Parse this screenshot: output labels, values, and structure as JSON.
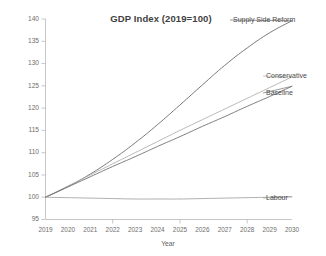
{
  "chart_data": {
    "type": "line",
    "title": "GDP Index (2019=100)",
    "xlabel": "Year",
    "ylabel": "",
    "grid": false,
    "legend_position": "inline-right-labels",
    "x": [
      2019,
      2020,
      2021,
      2022,
      2023,
      2024,
      2025,
      2026,
      2027,
      2028,
      2029,
      2030
    ],
    "xtick_labels": [
      "2019",
      "2020",
      "2021",
      "2022",
      "2023",
      "2024",
      "2025",
      "2026",
      "2027",
      "2028",
      "2029",
      "2030"
    ],
    "ytick_labels": [
      "95",
      "100",
      "105",
      "110",
      "115",
      "120",
      "125",
      "130",
      "135",
      "140"
    ],
    "ytick_values": [
      95,
      100,
      105,
      110,
      115,
      120,
      125,
      130,
      135,
      140
    ],
    "ylim": [
      95,
      140
    ],
    "xlim": [
      2019,
      2030
    ],
    "series": [
      {
        "name": "Supply Side Reform",
        "color": "#6b6b6b",
        "width": 0.9,
        "values": [
          100.0,
          102.4,
          105.2,
          108.5,
          112.2,
          116.3,
          120.7,
          125.2,
          129.6,
          133.5,
          136.9,
          139.6
        ]
      },
      {
        "name": "Conservative",
        "color": "#b0b0b0",
        "width": 0.9,
        "values": [
          100.0,
          102.5,
          105.0,
          107.5,
          110.0,
          112.5,
          115.0,
          117.4,
          119.8,
          122.2,
          124.6,
          127.0
        ]
      },
      {
        "name": "Baseline",
        "color": "#707070",
        "width": 0.9,
        "values": [
          100.0,
          102.3,
          104.6,
          106.9,
          109.1,
          111.4,
          113.6,
          115.9,
          118.1,
          120.4,
          122.6,
          124.9
        ]
      },
      {
        "name": "Labour",
        "color": "#9a9a9a",
        "width": 0.8,
        "values": [
          100.0,
          99.9,
          99.8,
          99.7,
          99.6,
          99.6,
          99.6,
          99.7,
          99.8,
          99.9,
          100.0,
          100.1
        ]
      }
    ],
    "annotations": [
      {
        "text": "Supply Side Reform",
        "series": "Supply Side Reform",
        "x": 233,
        "y": 20,
        "anchor": "start",
        "leader": true
      },
      {
        "text": "Conservative",
        "series": "Conservative",
        "x": 266,
        "y": 76,
        "anchor": "start",
        "leader": true
      },
      {
        "text": "Baseline",
        "series": "Baseline",
        "x": 266,
        "y": 93,
        "anchor": "start",
        "leader": true
      },
      {
        "text": "Labour",
        "series": "Labour",
        "x": 266,
        "y": 198,
        "anchor": "start",
        "leader": true
      }
    ]
  }
}
